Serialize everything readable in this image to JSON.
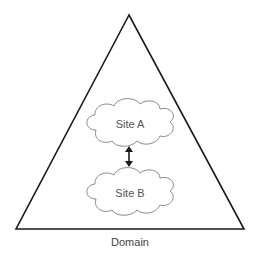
{
  "diagram": {
    "container": {
      "shape": "triangle",
      "label": "Domain",
      "stroke": "#1a1a1a"
    },
    "nodes": [
      {
        "id": "site-a",
        "shape": "cloud",
        "label": "Site A"
      },
      {
        "id": "site-b",
        "shape": "cloud",
        "label": "Site B"
      }
    ],
    "edges": [
      {
        "from": "site-a",
        "to": "site-b",
        "type": "bidirectional-arrow"
      }
    ],
    "colors": {
      "background": "#ffffff",
      "line": "#1a1a1a",
      "cloud_stroke": "#888888",
      "cloud_fill": "#ffffff",
      "text": "#555555"
    }
  }
}
